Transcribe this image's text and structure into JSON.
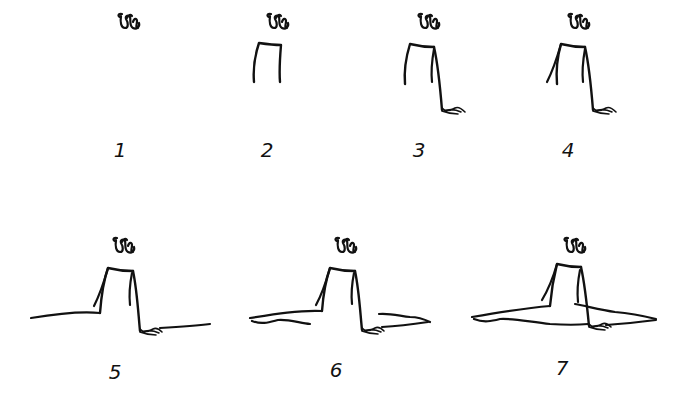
{
  "diagram": {
    "type": "step-by-step drawing tutorial",
    "stroke_color": "#111111",
    "background_color": "#ffffff",
    "steps": [
      {
        "label": "1",
        "elements": [
          "head"
        ]
      },
      {
        "label": "2",
        "elements": [
          "head",
          "torso"
        ]
      },
      {
        "label": "3",
        "elements": [
          "head",
          "torso",
          "right-arm",
          "right-hand"
        ]
      },
      {
        "label": "4",
        "elements": [
          "head",
          "torso",
          "right-arm",
          "right-hand",
          "left-arm"
        ]
      },
      {
        "label": "5",
        "elements": [
          "head",
          "torso",
          "right-arm",
          "right-hand",
          "left-arm",
          "left-leg-top",
          "right-leg-top"
        ]
      },
      {
        "label": "6",
        "elements": [
          "head",
          "torso",
          "right-arm",
          "right-hand",
          "left-arm",
          "left-leg-top",
          "right-leg-top",
          "left-leg-bottom",
          "right-leg-bottom"
        ]
      },
      {
        "label": "7",
        "elements": [
          "head",
          "torso",
          "right-arm",
          "right-hand",
          "left-arm",
          "left-leg-top",
          "right-leg-top",
          "left-leg-bottom",
          "right-leg-bottom",
          "leg-connection"
        ]
      }
    ]
  }
}
